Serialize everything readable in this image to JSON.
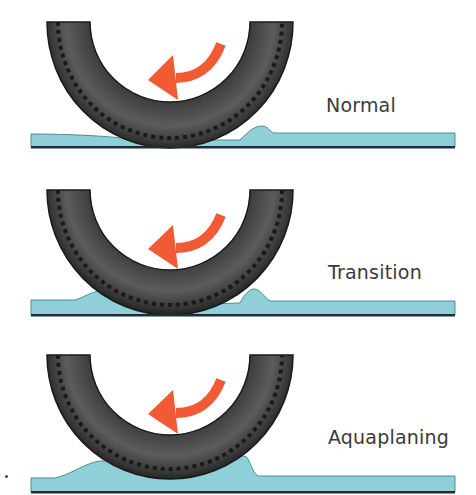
{
  "diagram": {
    "colors": {
      "tire_dark": "#2a2a2a",
      "tire_mid": "#4a4a4a",
      "tire_highlight": "#6a6a6a",
      "arrow": "#f25a35",
      "water": "#8fd0d8",
      "water_edge": "#4d8d96",
      "road": "#1e2e32",
      "label": "#3a3a3a"
    },
    "panels": [
      {
        "label": "Normal",
        "stage": "normal"
      },
      {
        "label": "Transition",
        "stage": "transition"
      },
      {
        "label": "Aquaplaning",
        "stage": "aquaplaning"
      }
    ]
  }
}
